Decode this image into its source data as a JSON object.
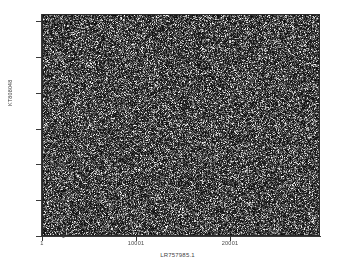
{
  "chart_data": {
    "type": "scatter",
    "title": "",
    "subtitle": "",
    "xlabel": "LR757985.1",
    "ylabel": "KT808048",
    "xlim": [
      1,
      29500
    ],
    "ylim": [
      1,
      31000
    ],
    "x_ticks": [
      {
        "value": 1,
        "label": "1"
      },
      {
        "value": 10001,
        "label": "10001"
      },
      {
        "value": 20001,
        "label": "20001"
      }
    ],
    "y_ticks": [
      {
        "value": 1,
        "label": "1"
      },
      {
        "value": 5001,
        "label": "5001"
      },
      {
        "value": 10001,
        "label": "10001"
      },
      {
        "value": 15001,
        "label": "15001"
      },
      {
        "value": 20001,
        "label": "20001"
      },
      {
        "value": 25001,
        "label": "25001"
      },
      {
        "value": 30001,
        "label": "30001"
      }
    ],
    "grid": false,
    "legend": "none",
    "legend_position": "none",
    "series": [
      {
        "name": "sequence-match-dots",
        "description": "dense uniform dot-plot match cloud covering the full plot area",
        "point_count": 120000,
        "color": "#e8e8e8",
        "background": "#111111"
      }
    ],
    "annotations": [],
    "colors": {
      "plot_background": "#111111",
      "point": "#e8e8e8",
      "axis": "#3a3a3a",
      "text": "#444444",
      "figure_background": "#ffffff"
    }
  },
  "figure": {
    "width": 355,
    "height": 268
  }
}
